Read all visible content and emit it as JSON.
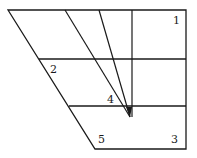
{
  "diagram": {
    "type": "geometry-figure",
    "stroke_color": "#1a1a1a",
    "background": "#ffffff",
    "outline": {
      "points": [
        [
          8,
          10
        ],
        [
          186,
          10
        ],
        [
          186,
          149
        ],
        [
          95,
          149
        ]
      ]
    },
    "horizontal_lines": [
      {
        "x1": 39,
        "y": 59,
        "x2": 186
      },
      {
        "x1": 69,
        "y": 106,
        "x2": 186
      }
    ],
    "converging_lines": [
      {
        "x1": 65,
        "y1": 10,
        "x2": 130,
        "y2": 117
      },
      {
        "x1": 99,
        "y1": 10,
        "x2": 130,
        "y2": 117
      },
      {
        "x1": 132,
        "y1": 10,
        "x2": 132,
        "y2": 117
      }
    ],
    "convergence_point": [
      130,
      117
    ],
    "labels": [
      {
        "text": "1",
        "x": 173,
        "y": 24
      },
      {
        "text": "2",
        "x": 50,
        "y": 73
      },
      {
        "text": "4",
        "x": 107,
        "y": 103
      },
      {
        "text": "5",
        "x": 98,
        "y": 143
      },
      {
        "text": "3",
        "x": 171,
        "y": 143
      }
    ]
  }
}
